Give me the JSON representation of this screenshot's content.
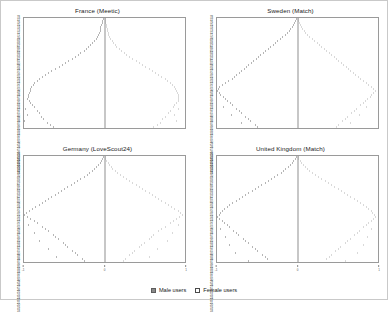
{
  "figure": {
    "background_color": "#ffffff",
    "border_color": "#c9c9c9"
  },
  "legend": {
    "position": "bottom-center",
    "items": [
      {
        "label": "Male users",
        "color": "#8a8a8a",
        "style": "filled"
      },
      {
        "label": "Female users",
        "color": "#ffffff",
        "style": "outlined"
      }
    ]
  },
  "chart_data": [
    {
      "type": "bar",
      "subtype": "population-pyramid",
      "title": "France (Meetic)",
      "panel": "top-left",
      "xlabel": "",
      "ylabel": "Age",
      "grid": false,
      "legend": [
        "Male users",
        "Female users"
      ],
      "series": [
        {
          "name": "Male users",
          "color": "#8a8a8a",
          "side": "left"
        },
        {
          "name": "Female users",
          "color": "#d3d3d3",
          "side": "right"
        }
      ],
      "categories": [
        78,
        77,
        76,
        75,
        74,
        73,
        72,
        71,
        70,
        69,
        68,
        67,
        66,
        65,
        64,
        63,
        62,
        61,
        60,
        59,
        58,
        57,
        56,
        55,
        54,
        53,
        52,
        51,
        50,
        49,
        48,
        47,
        46,
        45,
        44,
        43,
        42,
        41,
        40,
        39,
        38,
        37,
        36,
        35,
        34,
        33,
        32,
        31,
        30,
        29,
        28,
        27,
        26,
        25,
        24,
        23,
        22,
        21,
        20,
        19,
        18
      ],
      "male": [
        2,
        3,
        3,
        4,
        5,
        5,
        6,
        7,
        8,
        9,
        11,
        13,
        15,
        18,
        20,
        23,
        26,
        30,
        33,
        37,
        41,
        45,
        49,
        53,
        57,
        61,
        66,
        70,
        74,
        78,
        81,
        84,
        87,
        89,
        91,
        92,
        93,
        94,
        95,
        95,
        96,
        94,
        92,
        90,
        87,
        99,
        84,
        82,
        96,
        79,
        76,
        100,
        72,
        68,
        64,
        60,
        56,
        30,
        24,
        16,
        10
      ],
      "female": [
        1,
        2,
        2,
        3,
        3,
        4,
        4,
        5,
        6,
        7,
        8,
        10,
        12,
        14,
        16,
        19,
        22,
        25,
        28,
        32,
        36,
        40,
        44,
        48,
        52,
        56,
        60,
        64,
        68,
        72,
        76,
        79,
        82,
        85,
        87,
        89,
        90,
        91,
        92,
        93,
        93,
        92,
        90,
        88,
        86,
        92,
        82,
        80,
        88,
        76,
        73,
        90,
        70,
        66,
        62,
        58,
        54,
        34,
        27,
        18,
        11
      ],
      "xlim": [
        -100,
        100
      ],
      "ylim": [
        18,
        78
      ]
    },
    {
      "type": "bar",
      "subtype": "population-pyramid",
      "title": "Sweden (Match)",
      "panel": "top-right",
      "xlabel": "",
      "ylabel": "Age",
      "grid": false,
      "legend": [
        "Male users",
        "Female users"
      ],
      "series": [
        {
          "name": "Male users",
          "color": "#8a8a8a",
          "side": "left"
        },
        {
          "name": "Female users",
          "color": "#d3d3d3",
          "side": "right"
        }
      ],
      "categories": [
        78,
        77,
        76,
        75,
        74,
        73,
        72,
        71,
        70,
        69,
        68,
        67,
        66,
        65,
        64,
        63,
        62,
        61,
        60,
        59,
        58,
        57,
        56,
        55,
        54,
        53,
        52,
        51,
        50,
        49,
        48,
        47,
        46,
        45,
        44,
        43,
        42,
        41,
        40,
        39,
        38,
        37,
        36,
        35,
        34,
        33,
        32,
        31,
        30,
        29,
        28,
        27,
        26,
        25,
        24,
        23,
        22,
        21,
        20,
        19,
        18
      ],
      "male": [
        2,
        3,
        4,
        5,
        7,
        9,
        11,
        13,
        16,
        19,
        22,
        25,
        28,
        31,
        34,
        37,
        40,
        43,
        46,
        49,
        52,
        55,
        58,
        61,
        64,
        67,
        70,
        73,
        76,
        79,
        82,
        86,
        90,
        94,
        97,
        99,
        100,
        98,
        96,
        93,
        90,
        87,
        84,
        81,
        92,
        76,
        73,
        70,
        83,
        65,
        62,
        59,
        70,
        53,
        50,
        46,
        42,
        38,
        30,
        20,
        12
      ],
      "female": [
        1,
        2,
        3,
        4,
        5,
        7,
        9,
        11,
        13,
        16,
        19,
        22,
        25,
        28,
        31,
        34,
        37,
        40,
        43,
        46,
        49,
        52,
        55,
        58,
        61,
        64,
        67,
        70,
        73,
        76,
        79,
        82,
        86,
        89,
        92,
        95,
        97,
        95,
        93,
        91,
        88,
        85,
        82,
        79,
        86,
        74,
        71,
        68,
        78,
        63,
        60,
        57,
        66,
        52,
        49,
        45,
        41,
        37,
        29,
        19,
        11
      ],
      "xlim": [
        -100,
        100
      ],
      "ylim": [
        18,
        78
      ]
    },
    {
      "type": "bar",
      "subtype": "population-pyramid",
      "title": "Germany (LoveScout24)",
      "panel": "bottom-left",
      "xlabel": "",
      "ylabel": "Age",
      "grid": false,
      "legend": [
        "Male users",
        "Female users"
      ],
      "series": [
        {
          "name": "Male users",
          "color": "#8a8a8a",
          "side": "left"
        },
        {
          "name": "Female users",
          "color": "#d3d3d3",
          "side": "right"
        }
      ],
      "categories": [
        78,
        77,
        76,
        75,
        74,
        73,
        72,
        71,
        70,
        69,
        68,
        67,
        66,
        65,
        64,
        63,
        62,
        61,
        60,
        59,
        58,
        57,
        56,
        55,
        54,
        53,
        52,
        51,
        50,
        49,
        48,
        47,
        46,
        45,
        44,
        43,
        42,
        41,
        40,
        39,
        38,
        37,
        36,
        35,
        34,
        33,
        32,
        31,
        30,
        29,
        28,
        27,
        26,
        25,
        24,
        23,
        22,
        21,
        20,
        19,
        18
      ],
      "male": [
        2,
        3,
        4,
        6,
        8,
        10,
        13,
        16,
        19,
        22,
        26,
        30,
        34,
        38,
        42,
        46,
        50,
        54,
        58,
        62,
        66,
        70,
        74,
        78,
        82,
        86,
        90,
        94,
        97,
        100,
        96,
        92,
        88,
        84,
        95,
        78,
        74,
        70,
        88,
        64,
        61,
        58,
        82,
        52,
        49,
        46,
        70,
        40,
        37,
        34,
        60,
        28,
        25,
        22,
        40,
        16,
        13,
        11,
        8,
        5,
        3
      ],
      "female": [
        1,
        2,
        3,
        5,
        7,
        9,
        11,
        14,
        17,
        20,
        24,
        28,
        32,
        36,
        40,
        44,
        48,
        52,
        56,
        60,
        64,
        68,
        72,
        76,
        80,
        84,
        88,
        92,
        95,
        98,
        94,
        90,
        86,
        82,
        92,
        76,
        72,
        68,
        85,
        62,
        59,
        56,
        79,
        50,
        47,
        44,
        67,
        38,
        35,
        32,
        57,
        27,
        24,
        21,
        38,
        15,
        12,
        10,
        7,
        4,
        2
      ],
      "xlim": [
        -100,
        100
      ],
      "ylim": [
        18,
        78
      ]
    },
    {
      "type": "bar",
      "subtype": "population-pyramid",
      "title": "United Kingdom (Match)",
      "panel": "bottom-right",
      "xlabel": "",
      "ylabel": "Age",
      "grid": false,
      "legend": [
        "Male users",
        "Female users"
      ],
      "series": [
        {
          "name": "Male users",
          "color": "#8a8a8a",
          "side": "left"
        },
        {
          "name": "Female users",
          "color": "#d3d3d3",
          "side": "right"
        }
      ],
      "categories": [
        78,
        77,
        76,
        75,
        74,
        73,
        72,
        71,
        70,
        69,
        68,
        67,
        66,
        65,
        64,
        63,
        62,
        61,
        60,
        59,
        58,
        57,
        56,
        55,
        54,
        53,
        52,
        51,
        50,
        49,
        48,
        47,
        46,
        45,
        44,
        43,
        42,
        41,
        40,
        39,
        38,
        37,
        36,
        35,
        34,
        33,
        32,
        31,
        30,
        29,
        28,
        27,
        26,
        25,
        24,
        23,
        22,
        21,
        20,
        19,
        18
      ],
      "male": [
        2,
        3,
        5,
        7,
        9,
        12,
        15,
        18,
        21,
        25,
        29,
        33,
        37,
        41,
        45,
        49,
        53,
        57,
        61,
        65,
        69,
        73,
        77,
        81,
        85,
        88,
        91,
        94,
        96,
        98,
        100,
        97,
        94,
        91,
        88,
        85,
        96,
        80,
        77,
        74,
        90,
        68,
        65,
        62,
        85,
        56,
        53,
        50,
        78,
        44,
        41,
        38,
        62,
        32,
        28,
        24,
        20,
        16,
        12,
        8,
        4
      ],
      "female": [
        1,
        2,
        4,
        6,
        8,
        10,
        13,
        16,
        19,
        23,
        27,
        31,
        35,
        39,
        43,
        47,
        51,
        55,
        59,
        63,
        67,
        71,
        75,
        79,
        83,
        86,
        89,
        92,
        94,
        96,
        98,
        95,
        92,
        89,
        86,
        83,
        93,
        78,
        75,
        72,
        87,
        66,
        63,
        60,
        82,
        54,
        51,
        48,
        75,
        43,
        40,
        37,
        60,
        31,
        27,
        23,
        19,
        15,
        11,
        7,
        3
      ],
      "xlim": [
        -100,
        100
      ],
      "ylim": [
        18,
        78
      ]
    }
  ],
  "x_ticks": [
    "-1",
    "0",
    "1"
  ]
}
